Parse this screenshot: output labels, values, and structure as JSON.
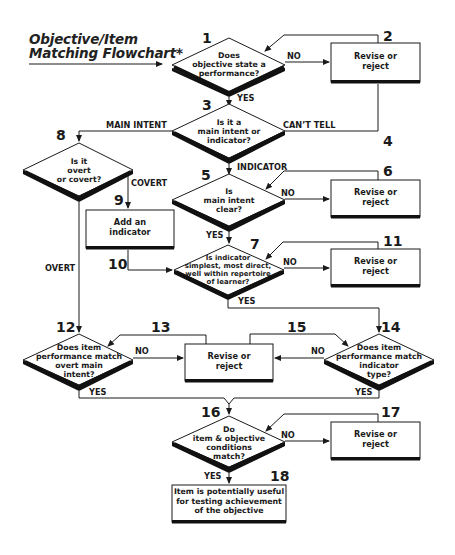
{
  "title": {
    "line1": "Objective/Item",
    "line2": "Matching Flowchart*"
  },
  "nodes": {
    "n1": {
      "number": "1",
      "type": "decision",
      "lines": [
        "Does",
        "objective state a",
        "performance?"
      ]
    },
    "n2": {
      "number": "2",
      "type": "process",
      "lines": [
        "Revise or",
        "reject"
      ]
    },
    "n3": {
      "number": "3",
      "type": "decision",
      "lines": [
        "Is it a",
        "main intent or",
        "indicator?"
      ]
    },
    "n4": {
      "number": "4"
    },
    "n5": {
      "number": "5",
      "type": "decision",
      "lines": [
        "Is",
        "main intent",
        "clear?"
      ]
    },
    "n6": {
      "number": "6",
      "type": "process",
      "lines": [
        "Revise or",
        "reject"
      ]
    },
    "n7": {
      "number": "7",
      "type": "decision",
      "lines": [
        "Is indicator",
        "simplest, most direct,",
        "well within repertoire",
        "of learner?"
      ]
    },
    "n8": {
      "number": "8",
      "type": "decision",
      "lines": [
        "Is it",
        "overt",
        "or covert?"
      ]
    },
    "n9": {
      "number": "9",
      "type": "process",
      "lines": [
        "Add an",
        "indicator"
      ]
    },
    "n10": {
      "number": "10"
    },
    "n11": {
      "number": "11",
      "type": "process",
      "lines": [
        "Revise or",
        "reject"
      ]
    },
    "n12": {
      "number": "12",
      "type": "decision",
      "lines": [
        "Does item",
        "performance match",
        "overt main",
        "intent?"
      ]
    },
    "n13": {
      "number": "13",
      "type": "process",
      "lines": [
        "Revise or",
        "reject"
      ]
    },
    "n14": {
      "number": "14",
      "type": "decision",
      "lines": [
        "Does item",
        "performance match",
        "indicator",
        "type?"
      ]
    },
    "n15": {
      "number": "15"
    },
    "n16": {
      "number": "16",
      "type": "decision",
      "lines": [
        "Do",
        "item & objective",
        "conditions",
        "match?"
      ]
    },
    "n17": {
      "number": "17",
      "type": "process",
      "lines": [
        "Revise or",
        "reject"
      ]
    },
    "n18": {
      "number": "18",
      "type": "terminal",
      "lines": [
        "Item is potentially useful",
        "for testing achievement",
        "of the objective"
      ]
    }
  },
  "edge_labels": {
    "n1_no": "NO",
    "n1_yes": "YES",
    "n3_main": "MAIN INTENT",
    "n3_cant": "CAN’T TELL",
    "n3_indicator": "INDICATOR",
    "n5_no": "NO",
    "n5_yes": "YES",
    "n8_covert": "COVERT",
    "n8_overt": "OVERT",
    "n7_no": "NO",
    "n7_yes": "YES",
    "n12_no": "NO",
    "n12_yes": "YES",
    "n14_no": "NO",
    "n14_yes": "YES",
    "n16_no": "NO",
    "n16_yes": "YES"
  },
  "colors": {
    "line": "#1a1a1a",
    "shadow": "#111111",
    "background": "#ffffff"
  }
}
